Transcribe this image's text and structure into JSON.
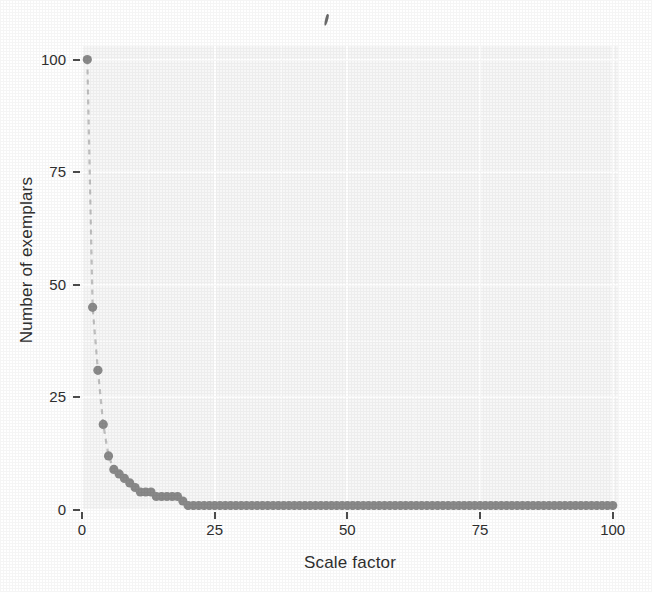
{
  "figure": {
    "background_color": "#ffffff",
    "panel_color": "#f7f7f7",
    "gridline_color": "#ffffff",
    "marker_color": "#8a8a8a",
    "line_color": "#c0c0c0",
    "text_color": "#2f2f2f",
    "artifact_name": "scan-artifact-comma"
  },
  "chart_data": {
    "type": "scatter",
    "title": "",
    "xlabel": "Scale factor",
    "ylabel": "Number of exemplars",
    "xlim": [
      0,
      101
    ],
    "ylim": [
      0,
      103
    ],
    "xticks": [
      0,
      25,
      50,
      75,
      100
    ],
    "yticks": [
      0,
      25,
      50,
      75,
      100
    ],
    "xtick_labels": [
      "0",
      "25",
      "50",
      "75",
      "100"
    ],
    "ytick_labels": [
      "0",
      "25",
      "50",
      "75",
      "100"
    ],
    "grid": true,
    "grid_color": "#ffffff",
    "legend": false,
    "connector": "dashed-line",
    "marker": "filled-circle",
    "series": [
      {
        "name": "exemplars-by-scale-factor",
        "x": [
          1,
          2,
          3,
          4,
          5,
          6,
          7,
          8,
          9,
          10,
          11,
          12,
          13,
          14,
          15,
          16,
          17,
          18,
          19,
          20,
          21,
          22,
          23,
          24,
          25,
          26,
          27,
          28,
          29,
          30,
          31,
          32,
          33,
          34,
          35,
          36,
          37,
          38,
          39,
          40,
          41,
          42,
          43,
          44,
          45,
          46,
          47,
          48,
          49,
          50,
          51,
          52,
          53,
          54,
          55,
          56,
          57,
          58,
          59,
          60,
          61,
          62,
          63,
          64,
          65,
          66,
          67,
          68,
          69,
          70,
          71,
          72,
          73,
          74,
          75,
          76,
          77,
          78,
          79,
          80,
          81,
          82,
          83,
          84,
          85,
          86,
          87,
          88,
          89,
          90,
          91,
          92,
          93,
          94,
          95,
          96,
          97,
          98,
          99,
          100
        ],
        "y": [
          100,
          45,
          31,
          19,
          12,
          9,
          8,
          7,
          6,
          5,
          4,
          4,
          4,
          3,
          3,
          3,
          3,
          3,
          2,
          1,
          1,
          1,
          1,
          1,
          1,
          1,
          1,
          1,
          1,
          1,
          1,
          1,
          1,
          1,
          1,
          1,
          1,
          1,
          1,
          1,
          1,
          1,
          1,
          1,
          1,
          1,
          1,
          1,
          1,
          1,
          1,
          1,
          1,
          1,
          1,
          1,
          1,
          1,
          1,
          1,
          1,
          1,
          1,
          1,
          1,
          1,
          1,
          1,
          1,
          1,
          1,
          1,
          1,
          1,
          1,
          1,
          1,
          1,
          1,
          1,
          1,
          1,
          1,
          1,
          1,
          1,
          1,
          1,
          1,
          1,
          1,
          1,
          1,
          1,
          1,
          1,
          1,
          1,
          1,
          1
        ]
      }
    ]
  }
}
